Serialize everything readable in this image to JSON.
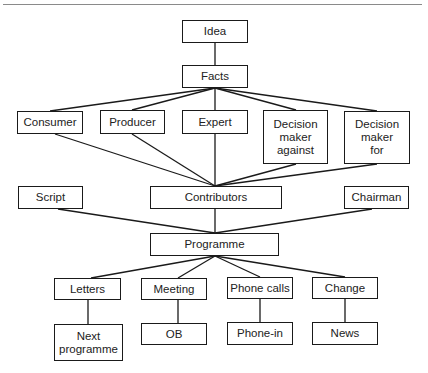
{
  "diagram": {
    "nodes": {
      "idea": "Idea",
      "facts": "Facts",
      "consumer": "Consumer",
      "producer": "Producer",
      "expert": "Expert",
      "dm_against": "Decision\nmaker\nagainst",
      "dm_for": "Decision\nmaker\nfor",
      "script": "Script",
      "contributors": "Contributors",
      "chairman": "Chairman",
      "programme": "Programme",
      "letters": "Letters",
      "meeting": "Meeting",
      "phone_calls": "Phone calls",
      "change": "Change",
      "next_programme": "Next\nprogramme",
      "ob": "OB",
      "phone_in": "Phone-in",
      "news": "News"
    },
    "edges": [
      [
        "idea",
        "facts"
      ],
      [
        "facts",
        "consumer"
      ],
      [
        "facts",
        "producer"
      ],
      [
        "facts",
        "expert"
      ],
      [
        "facts",
        "dm_against"
      ],
      [
        "facts",
        "dm_for"
      ],
      [
        "consumer",
        "contributors"
      ],
      [
        "producer",
        "contributors"
      ],
      [
        "expert",
        "contributors"
      ],
      [
        "dm_against",
        "contributors"
      ],
      [
        "dm_for",
        "contributors"
      ],
      [
        "script",
        "programme"
      ],
      [
        "contributors",
        "programme"
      ],
      [
        "chairman",
        "programme"
      ],
      [
        "programme",
        "letters"
      ],
      [
        "programme",
        "meeting"
      ],
      [
        "programme",
        "phone_calls"
      ],
      [
        "programme",
        "change"
      ],
      [
        "letters",
        "next_programme"
      ],
      [
        "meeting",
        "ob"
      ],
      [
        "phone_calls",
        "phone_in"
      ],
      [
        "change",
        "news"
      ]
    ]
  }
}
